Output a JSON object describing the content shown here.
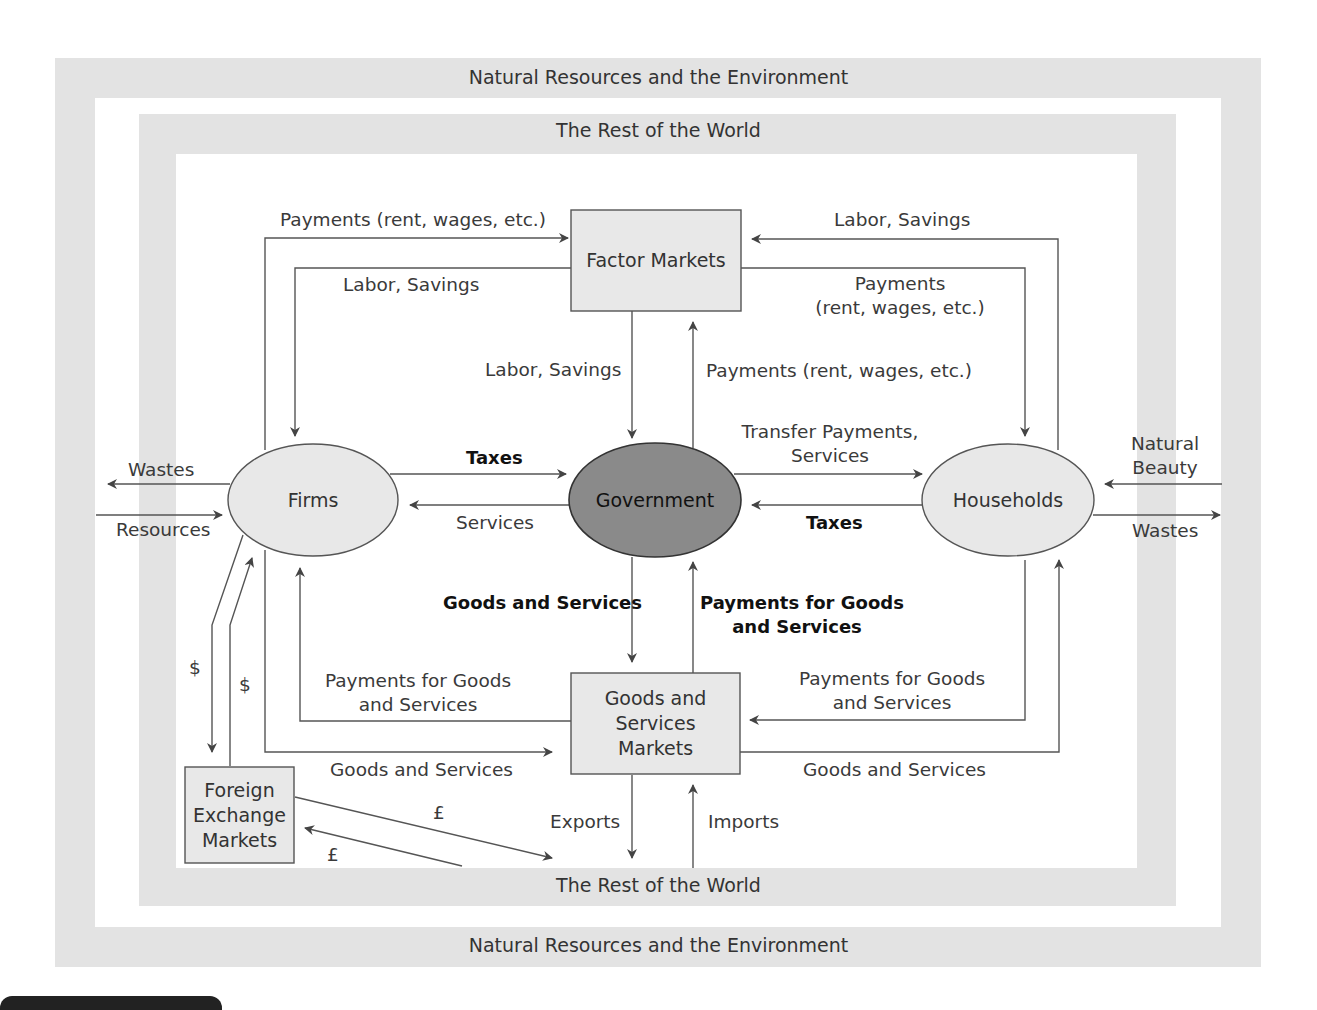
{
  "bands": {
    "outer_top": "Natural Resources and the Environment",
    "outer_bottom": "Natural Resources and the Environment",
    "inner_top": "The Rest of the World",
    "inner_bottom": "The Rest of the World"
  },
  "nodes": {
    "factor_markets": "Factor Markets",
    "firms": "Firms",
    "government": "Government",
    "households": "Households",
    "goods_markets": [
      "Goods and",
      "Services",
      "Markets"
    ],
    "forex": [
      "Foreign",
      "Exchange",
      "Markets"
    ]
  },
  "flows": {
    "firms_to_factor": "Payments (rent, wages, etc.)",
    "factor_to_firms": "Labor, Savings",
    "households_to_factor": "Labor, Savings",
    "factor_to_households": [
      "Payments",
      "(rent, wages, etc.)"
    ],
    "factor_to_gov": "Labor, Savings",
    "gov_to_factor": "Payments (rent, wages, etc.)",
    "firms_to_gov": "Taxes",
    "gov_to_firms": "Services",
    "gov_to_households": [
      "Transfer Payments,",
      "Services"
    ],
    "households_to_gov": "Taxes",
    "gov_to_goods": "Goods and Services",
    "goods_to_gov": [
      "Payments for Goods",
      "and Services"
    ],
    "firms_payments": [
      "Payments for Goods",
      "and Services"
    ],
    "firms_goods": "Goods and Services",
    "households_payments": [
      "Payments for Goods",
      "and Services"
    ],
    "households_goods": "Goods and Services",
    "exports": "Exports",
    "imports": "Imports",
    "firms_wastes": "Wastes",
    "firms_resources": "Resources",
    "households_beauty": [
      "Natural",
      "Beauty"
    ],
    "households_wastes": "Wastes",
    "dollar_out": "$",
    "dollar_in": "$",
    "pound_out": "£",
    "pound_in": "£"
  },
  "colors": {
    "band": "#e3e3e3",
    "node_fill": "#e8e8e8",
    "government_fill": "#8a8a8a",
    "line": "#555555"
  }
}
